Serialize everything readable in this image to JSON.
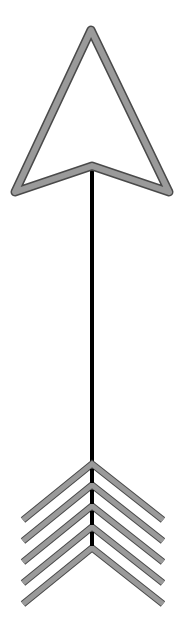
{
  "canvas": {
    "width": 186,
    "height": 634,
    "background": "#ffffff"
  },
  "arrow": {
    "direction": "up",
    "colors": {
      "outline": "#4a4a4a",
      "fill_band": "#9a9a9a",
      "inner": "#ffffff",
      "shaft": "#000000"
    },
    "head": {
      "apex": [
        91,
        30
      ],
      "left_tip": [
        15,
        192
      ],
      "right_tip": [
        169,
        192
      ],
      "notch": [
        92,
        166
      ]
    },
    "shaft": {
      "x": 92,
      "top": 168,
      "bottom": 548,
      "width": 4
    },
    "fletching": {
      "count": 5,
      "apex_x": 92,
      "apex_y": [
        464,
        485,
        506,
        527,
        548
      ],
      "left_x": 23,
      "right_x": 163,
      "drop": 56
    }
  }
}
